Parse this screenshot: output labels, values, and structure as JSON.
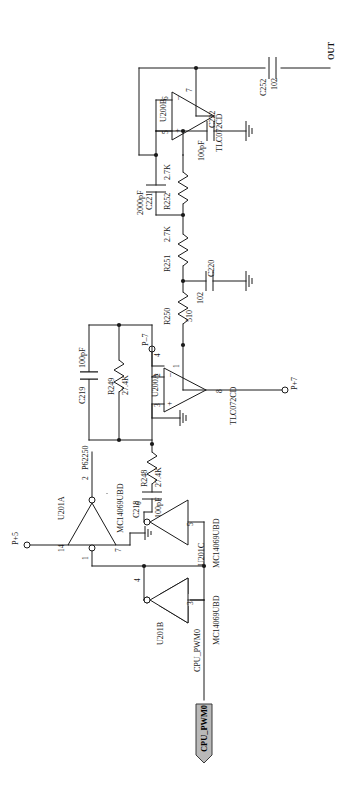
{
  "sheet": {
    "title": "Audio output driver schematic (rotated 90 degrees)",
    "orientation": "landscape-rotated"
  },
  "nets": {
    "out": "OUT",
    "cpu_pwm0_label": "CPU_PWM0",
    "cpu_pwm0_flag": "CPU_PWM0",
    "p62250": "P62250"
  },
  "testpoints": [
    {
      "name": "P+5",
      "label": "P+5"
    },
    {
      "name": "P-7",
      "label": "P–7"
    },
    {
      "name": "P+7",
      "label": "P+7"
    }
  ],
  "opamps": [
    {
      "ref": "U200B",
      "part": "TLC072CD",
      "pins": {
        "out": "7",
        "inv": "6",
        "noninv": "5"
      },
      "marks": {
        "inv": "–",
        "noninv": "+"
      }
    },
    {
      "ref": "U200A",
      "part": "TLC072CD",
      "pins": {
        "out": "1",
        "inv": "2",
        "noninv": "3",
        "v_neg": "4",
        "v_pos": "8"
      },
      "marks": {
        "inv": "–",
        "noninv": "+"
      }
    }
  ],
  "inverters": [
    {
      "ref": "U201A",
      "part": "MC14069UBD",
      "pins": {
        "in": "1",
        "out": "2",
        "vdd": "14",
        "vss": "7"
      }
    },
    {
      "ref": "U201C",
      "part": "MC14069UBD",
      "pins": {
        "in": "5",
        "out": "6"
      }
    },
    {
      "ref": "U201B",
      "part": "MC14069UBD",
      "pins": {
        "in": "3",
        "out": "4"
      }
    }
  ],
  "components": [
    {
      "ref": "C252",
      "value": "102",
      "type": "capacitor"
    },
    {
      "ref": "C222",
      "value": "100pF",
      "type": "capacitor"
    },
    {
      "ref": "C221",
      "value": "2000pF",
      "type": "capacitor"
    },
    {
      "ref": "C220",
      "value": "102",
      "type": "capacitor"
    },
    {
      "ref": "C219",
      "value": "100pF",
      "type": "capacitor"
    },
    {
      "ref": "C218",
      "value": "100pF",
      "type": "capacitor"
    },
    {
      "ref": "R252",
      "value": "2.7K",
      "type": "resistor"
    },
    {
      "ref": "R251",
      "value": "2.7K",
      "type": "resistor"
    },
    {
      "ref": "R250",
      "value": "510",
      "type": "resistor"
    },
    {
      "ref": "R249",
      "value": "27.4K",
      "type": "resistor"
    },
    {
      "ref": "R248",
      "value": "27.4K",
      "type": "resistor"
    }
  ],
  "colors": {
    "ink": "#1a1a1a",
    "paper": "#ffffff",
    "flag_fill": "#b9b9b9"
  }
}
